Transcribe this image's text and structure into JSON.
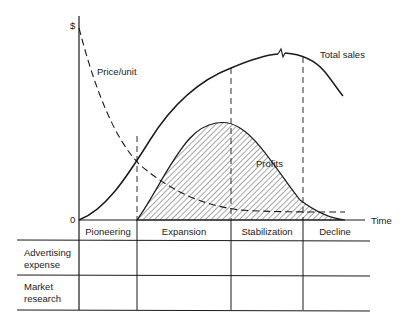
{
  "diagram": {
    "y_axis_label": "$",
    "origin_label": "0",
    "x_axis_label": "Time",
    "curves": {
      "total_sales": "Total sales",
      "price_per_unit": "Price/unit",
      "profits": "Profits"
    },
    "stages": [
      "Pioneering",
      "Expansion",
      "Stabilization",
      "Decline"
    ],
    "table": {
      "rows": [
        {
          "label_line1": "Advertising",
          "label_line2": "expense"
        },
        {
          "label_line1": "Market",
          "label_line2": "research"
        }
      ]
    }
  }
}
